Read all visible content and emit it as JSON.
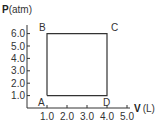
{
  "chart_data": {
    "type": "line",
    "title": "",
    "xlabel": {
      "symbol": "V",
      "unit": "(L)"
    },
    "ylabel": {
      "symbol": "P",
      "unit": "(atm)"
    },
    "xlim": [
      0,
      5.0
    ],
    "ylim": [
      0,
      6.0
    ],
    "x_ticks": [
      1.0,
      2.0,
      3.0,
      4.0,
      5.0
    ],
    "x_tick_labels": [
      "1.0",
      "2.0",
      "3.0",
      "4.0",
      "5.0"
    ],
    "y_ticks": [
      1.0,
      2.0,
      3.0,
      4.0,
      5.0,
      6.0
    ],
    "y_tick_labels": [
      "1.0",
      "2.0",
      "3.0",
      "4.0",
      "5.0",
      "6.0"
    ],
    "grid": false,
    "points": [
      {
        "label": "A",
        "x": 1.0,
        "y": 1.0
      },
      {
        "label": "B",
        "x": 1.0,
        "y": 6.0
      },
      {
        "label": "C",
        "x": 4.0,
        "y": 6.0
      },
      {
        "label": "D",
        "x": 4.0,
        "y": 1.0
      }
    ],
    "series": [
      {
        "name": "cycle A-B-C-D",
        "path": [
          "A",
          "B",
          "C",
          "D",
          "A"
        ],
        "color": "#333333"
      }
    ]
  }
}
